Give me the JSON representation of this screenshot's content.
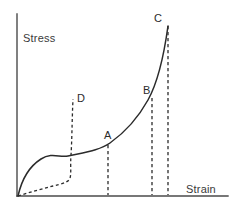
{
  "figure": {
    "title_visible": false,
    "background_color": "#ffffff",
    "ink_color": "#2b2b2b",
    "axis_color": "#4a4a4a"
  },
  "axes": {
    "y_label": "Stress",
    "x_label": "Strain",
    "y_label_pos": {
      "x": 23,
      "y": 42
    },
    "x_label_pos": {
      "x": 186,
      "y": 193
    },
    "origin": {
      "x": 17,
      "y": 196
    },
    "y_axis_top": {
      "x": 17,
      "y": 14
    },
    "x_axis_right": {
      "x": 228,
      "y": 196
    },
    "ticks": [],
    "gridlines": false
  },
  "point_labels": [
    {
      "id": "D",
      "text": "D",
      "x": 77,
      "y": 102
    },
    {
      "id": "A",
      "text": "A",
      "x": 104,
      "y": 139
    },
    {
      "id": "B",
      "text": "B",
      "x": 143,
      "y": 94
    },
    {
      "id": "C",
      "text": "C",
      "x": 154,
      "y": 22
    }
  ],
  "paths": {
    "main_curve": "M 18 196 C 22 178 30 166 41 159 C 52 152 60 158 68 156 C 86 152 100 150 110 143 C 124 133 138 118 148 100 C 158 82 164 55 168 26",
    "dashed_recovery": "M 18 196 C 30 192 42 189 53 186 C 61 184 66 183 69 180 C 72 176 70 168 71 155 C 72 140 72 120 73 99",
    "drop_lines": [
      {
        "id": "drop-A",
        "d": "M 108 145 L 108 195"
      },
      {
        "id": "drop-B",
        "d": "M 152 98 L 152 195"
      },
      {
        "id": "drop-C",
        "d": "M 168 26 L 168 195"
      }
    ]
  },
  "chart_data": {
    "type": "line",
    "title": "",
    "xlabel": "Strain",
    "ylabel": "Stress",
    "grid": false,
    "legend": "none",
    "axis_ticks_labeled": false,
    "annotations": [
      "A",
      "B",
      "C",
      "D"
    ],
    "series": [
      {
        "name": "loading-curve",
        "style": "solid",
        "description": "Stress rises steeply from origin, flattens into a plateau, then rises sharply to failure at C",
        "points": [
          {
            "x": 0.0,
            "y": 0.0
          },
          {
            "x": 0.05,
            "y": 0.26
          },
          {
            "x": 0.11,
            "y": 0.38
          },
          {
            "x": 0.16,
            "y": 0.42
          },
          {
            "x": 0.24,
            "y": 0.44
          },
          {
            "x": 0.33,
            "y": 0.46
          },
          {
            "x": 0.43,
            "y": 0.5
          },
          {
            "x": 0.52,
            "y": 0.56
          },
          {
            "x": 0.62,
            "y": 0.66
          },
          {
            "x": 0.7,
            "y": 0.77
          },
          {
            "x": 0.74,
            "y": 0.86
          },
          {
            "x": 0.78,
            "y": 0.93
          },
          {
            "x": 0.81,
            "y": 0.98
          }
        ]
      },
      {
        "name": "recovery-curve",
        "style": "dashed",
        "description": "Dashed return path from origin running near the strain axis then rising steeply to D",
        "points": [
          {
            "x": 0.0,
            "y": 0.0
          },
          {
            "x": 0.08,
            "y": 0.03
          },
          {
            "x": 0.15,
            "y": 0.05
          },
          {
            "x": 0.21,
            "y": 0.07
          },
          {
            "x": 0.25,
            "y": 0.1
          },
          {
            "x": 0.26,
            "y": 0.18
          },
          {
            "x": 0.26,
            "y": 0.3
          },
          {
            "x": 0.27,
            "y": 0.45
          },
          {
            "x": 0.27,
            "y": 0.54
          }
        ]
      }
    ],
    "markers": [
      {
        "label": "A",
        "x": 0.5,
        "y": 0.52,
        "note": "point on plateau where curve begins to rise"
      },
      {
        "label": "B",
        "x": 0.74,
        "y": 0.8,
        "note": "point on steep rise"
      },
      {
        "label": "C",
        "x": 0.83,
        "y": 1.0,
        "note": "top of curve, failure point"
      },
      {
        "label": "D",
        "x": 0.31,
        "y": 0.62,
        "note": "top of dashed recovery curve"
      }
    ]
  }
}
